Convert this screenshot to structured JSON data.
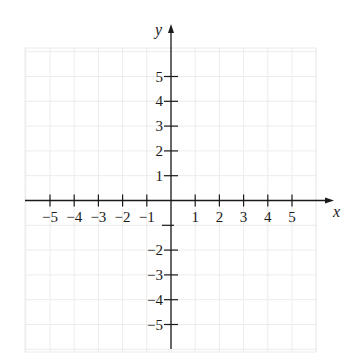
{
  "chart_data": {
    "type": "scatter",
    "title": "",
    "xlabel": "x",
    "ylabel": "y",
    "xlim": [
      -6,
      6
    ],
    "ylim": [
      -6,
      6
    ],
    "grid": true,
    "x_ticks": [
      -5,
      -4,
      -3,
      -2,
      -1,
      1,
      2,
      3,
      4,
      5
    ],
    "x_tick_labels": [
      "−5",
      "−4",
      "−3",
      "−2",
      "−1",
      "1",
      "2",
      "3",
      "4",
      "5"
    ],
    "y_ticks": [
      5,
      4,
      3,
      2,
      1,
      -1,
      -2,
      -3,
      -4,
      -5
    ],
    "y_tick_labels": [
      "5",
      "4",
      "3",
      "2",
      "1",
      "",
      "−2",
      "−3",
      "−4",
      "−5"
    ],
    "series": [],
    "legend": null
  },
  "colors": {
    "axis": "#1a1a1a",
    "grid": "#ececec",
    "background": "#ffffff"
  }
}
